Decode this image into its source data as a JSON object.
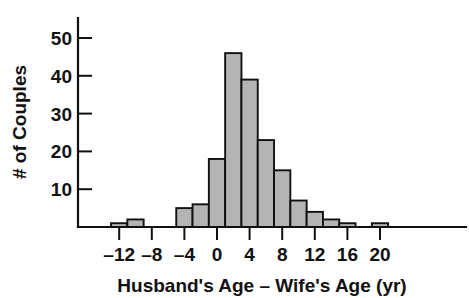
{
  "chart_data": {
    "type": "bar",
    "title": "",
    "subtitle": "",
    "xlabel": "Husband's Age – Wife's Age (yr)",
    "ylabel": "# of Couples",
    "grid": false,
    "legend": null,
    "xlim": [
      -14,
      22
    ],
    "ylim": [
      0,
      54
    ],
    "bin_width": 2,
    "xticks": [
      -12,
      -8,
      -4,
      0,
      4,
      8,
      12,
      16,
      20
    ],
    "xtick_labels": [
      "–12",
      "–8",
      "–4",
      "0",
      "4",
      "8",
      "12",
      "16",
      "20"
    ],
    "yticks": [
      10,
      20,
      30,
      40,
      50
    ],
    "ytick_labels": [
      "10",
      "20",
      "30",
      "40",
      "50"
    ],
    "bin_edges": [
      -13,
      -11,
      -9,
      -7,
      -5,
      -3,
      -1,
      1,
      3,
      5,
      7,
      9,
      11,
      13,
      15,
      17,
      19,
      21
    ],
    "categories": [
      "-13 to -11",
      "-11 to -9",
      "-9 to -7",
      "-7 to -5",
      "-5 to -3",
      "-3 to -1",
      "-1 to 1",
      "1 to 3",
      "3 to 5",
      "5 to 7",
      "7 to 9",
      "9 to 11",
      "11 to 13",
      "13 to 15",
      "15 to 17",
      "17 to 19",
      "19 to 21"
    ],
    "values": [
      1,
      2,
      0,
      0,
      5,
      6,
      18,
      46,
      39,
      23,
      15,
      7,
      4,
      2,
      1,
      0,
      1
    ],
    "bar_fill_color": "#b4b4b4",
    "bar_edge_color": "#111111",
    "axis_color": "#111111",
    "background_color": "#ffffff"
  }
}
